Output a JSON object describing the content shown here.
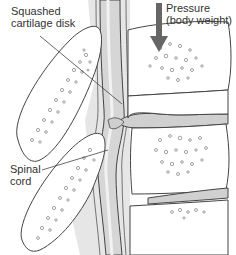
{
  "diagram": {
    "labels": {
      "squashed_disk": [
        "Squashed",
        "cartilage disk"
      ],
      "pressure": [
        "Pressure",
        "(body weight)"
      ],
      "spinal_cord": [
        "Spinal",
        "cord"
      ]
    },
    "colors": {
      "outline": "#444444",
      "bone_fill": "#ffffff",
      "cord_fill": "#d9d9d9",
      "cord_shadow": "#bdbdbd",
      "disk_fill": "#cfcfcf",
      "arrow": "#666666",
      "background": "#ffffff"
    }
  }
}
